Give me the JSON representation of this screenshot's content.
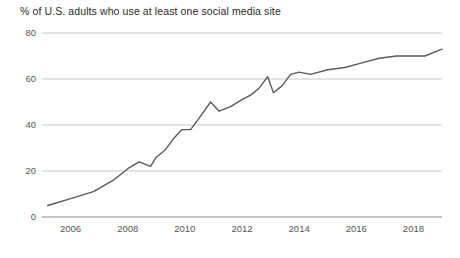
{
  "chart_data": {
    "type": "line",
    "title": "% of U.S. adults who use at least one social media site",
    "xlabel": "",
    "ylabel": "",
    "ylim": [
      0,
      80
    ],
    "xlim": [
      2005,
      2019
    ],
    "grid": true,
    "legend_position": "none",
    "y_ticks": [
      0,
      20,
      40,
      60,
      80
    ],
    "y_tick_labels": [
      "0",
      "20",
      "40",
      "60",
      "80"
    ],
    "x_ticks": [
      2006,
      2008,
      2010,
      2012,
      2014,
      2016,
      2018
    ],
    "x_tick_labels": [
      "2006",
      "2008",
      "2010",
      "2012",
      "2014",
      "2016",
      "2018"
    ],
    "series": [
      {
        "name": "% of U.S. adults who use at least one social media site",
        "color": "#5a5a5a",
        "x": [
          2005.2,
          2006.0,
          2006.8,
          2007.5,
          2008.0,
          2008.4,
          2008.8,
          2009.0,
          2009.3,
          2009.6,
          2009.9,
          2010.2,
          2010.5,
          2010.9,
          2011.2,
          2011.6,
          2012.0,
          2012.3,
          2012.6,
          2012.9,
          2013.1,
          2013.4,
          2013.7,
          2014.0,
          2014.4,
          2015.0,
          2015.6,
          2016.2,
          2016.8,
          2017.4,
          2018.0,
          2018.4,
          2018.8,
          2019.0
        ],
        "y": [
          5,
          8,
          11,
          16,
          21,
          24,
          22,
          26,
          29,
          34,
          38,
          38,
          43,
          50,
          46,
          48,
          51,
          53,
          56,
          61,
          54,
          57,
          62,
          63,
          62,
          64,
          65,
          67,
          69,
          70,
          70,
          70,
          72,
          73
        ]
      }
    ]
  },
  "axis_colors": {
    "gridline": "#c9c9c9",
    "axis": "#8c8c8c",
    "tick_text": "#555555",
    "title_text": "#2b2b2b",
    "line": "#5a5a5a"
  },
  "plot_geometry": {
    "left": 42,
    "right": 442,
    "top": 33,
    "bottom": 217
  }
}
